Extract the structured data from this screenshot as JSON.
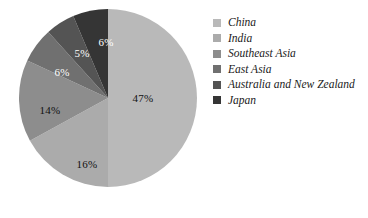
{
  "chart_data": {
    "type": "pie",
    "title": "",
    "subtitle": "",
    "xlabel": "",
    "ylabel": "",
    "grid": false,
    "legend_position": "right",
    "start_angle_deg": 0,
    "direction": "clockwise",
    "categories": [
      "China",
      "India",
      "Southeast Asia",
      "East Asia",
      "Australia and New Zealand",
      "Japan"
    ],
    "values": [
      47,
      16,
      14,
      6,
      5,
      6
    ],
    "value_unit": "%",
    "data_labels": [
      "47%",
      "16%",
      "14%",
      "6%",
      "5%",
      "6%"
    ],
    "colors": [
      "#b9b9b9",
      "#ababab",
      "#8d8d8d",
      "#707070",
      "#545454",
      "#353535"
    ],
    "slices": [
      {
        "label": "China",
        "value": 47,
        "data_label": "47%",
        "color": "#b9b9b9",
        "label_color": "dark",
        "label_x": 125,
        "label_y": 90
      },
      {
        "label": "India",
        "value": 16,
        "data_label": "16%",
        "color": "#ababab",
        "label_color": "dark",
        "label_x": 69,
        "label_y": 156
      },
      {
        "label": "Southeast Asia",
        "value": 14,
        "data_label": "14%",
        "color": "#8d8d8d",
        "label_color": "dark",
        "label_x": 32,
        "label_y": 102
      },
      {
        "label": "East Asia",
        "value": 6,
        "data_label": "6%",
        "color": "#707070",
        "label_color": "light",
        "label_x": 44,
        "label_y": 64
      },
      {
        "label": "Australia and New Zealand",
        "value": 5,
        "data_label": "5%",
        "color": "#545454",
        "label_color": "light",
        "label_x": 64,
        "label_y": 45
      },
      {
        "label": "Japan",
        "value": 6,
        "data_label": "6%",
        "color": "#353535",
        "label_color": "light",
        "label_x": 88,
        "label_y": 34
      }
    ]
  },
  "legend": {
    "items": [
      {
        "label": "China",
        "color": "#b9b9b9"
      },
      {
        "label": "India",
        "color": "#ababab"
      },
      {
        "label": "Southeast Asia",
        "color": "#8d8d8d"
      },
      {
        "label": "East Asia",
        "color": "#707070"
      },
      {
        "label": "Australia and New Zealand",
        "color": "#545454"
      },
      {
        "label": "Japan",
        "color": "#353535"
      }
    ]
  }
}
